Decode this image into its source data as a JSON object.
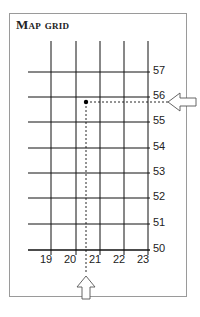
{
  "title": "Map grid",
  "grid": {
    "x_labels": [
      "19",
      "20",
      "21",
      "22",
      "23"
    ],
    "y_labels": [
      "57",
      "56",
      "55",
      "54",
      "53",
      "52",
      "51",
      "50"
    ]
  },
  "point": {
    "x": 20.5,
    "y": 55.8
  },
  "arrows": [
    "up-arrow-bottom",
    "left-arrow-right"
  ]
}
